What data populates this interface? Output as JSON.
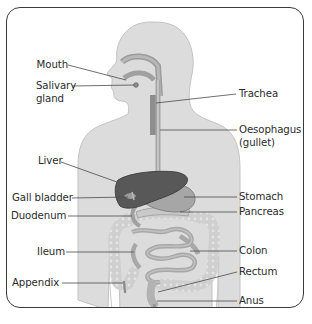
{
  "diagram": {
    "colors": {
      "frame": "#3a3a3a",
      "body": "#dcdcdc",
      "body_outline": "#bdbdbd",
      "tube": "#9a9a9a",
      "liver": "#5a5a5a",
      "stomach": "#a8a8a8",
      "intestine": "#b9b9b9",
      "colon": "#d0d0d0",
      "leader_line": "#4a4a4a",
      "text": "#2b2b2b"
    },
    "labels_left": [
      {
        "id": "mouth",
        "text": "Mouth"
      },
      {
        "id": "salivary",
        "line1": "Salivary",
        "line2": "gland"
      },
      {
        "id": "liver",
        "text": "Liver"
      },
      {
        "id": "gall",
        "text": "Gall bladder"
      },
      {
        "id": "duodenum",
        "text": "Duodenum"
      },
      {
        "id": "ileum",
        "text": "Ileum"
      },
      {
        "id": "appendix",
        "text": "Appendix"
      }
    ],
    "labels_right": [
      {
        "id": "trachea",
        "text": "Trachea"
      },
      {
        "id": "oesophagus",
        "line1": "Oesophagus",
        "line2": "(gullet)"
      },
      {
        "id": "stomach",
        "text": "Stomach"
      },
      {
        "id": "pancreas",
        "text": "Pancreas"
      },
      {
        "id": "colon",
        "text": "Colon"
      },
      {
        "id": "rectum",
        "text": "Rectum"
      },
      {
        "id": "anus",
        "text": "Anus"
      }
    ]
  }
}
